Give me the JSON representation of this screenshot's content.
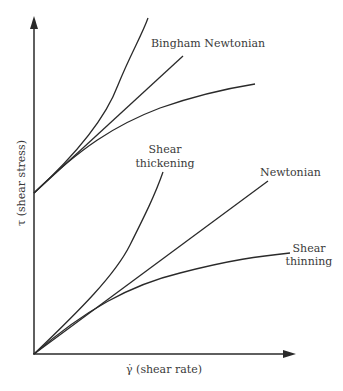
{
  "diagram": {
    "axes": {
      "y_label": "τ (shear stress)",
      "x_label": "γ̇ (shear rate)"
    },
    "labels": {
      "bingham_newtonian": "Bingham Newtonian",
      "shear_thickening_line1": "Shear",
      "shear_thickening_line2": "thickening",
      "newtonian": "Newtonian",
      "shear_thinning_line1": "Shear",
      "shear_thinning_line2": "thinning"
    },
    "curves": [
      {
        "name": "Bingham shear thickening",
        "origin": "yield stress",
        "shape": "convex"
      },
      {
        "name": "Bingham Newtonian",
        "origin": "yield stress",
        "shape": "linear"
      },
      {
        "name": "Bingham shear thinning",
        "origin": "yield stress",
        "shape": "concave"
      },
      {
        "name": "Shear thickening",
        "origin": "zero",
        "shape": "convex"
      },
      {
        "name": "Newtonian",
        "origin": "zero",
        "shape": "linear"
      },
      {
        "name": "Shear thinning",
        "origin": "zero",
        "shape": "concave"
      }
    ],
    "colors": {
      "line": "#2a2a2a",
      "text": "#3a3a3a",
      "background": "#ffffff"
    }
  }
}
